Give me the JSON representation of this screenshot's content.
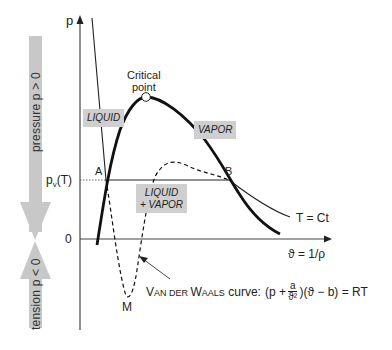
{
  "diagram": {
    "axes": {
      "y_label": "p",
      "x_label": "ϑ = 1/ρ",
      "pv_label_main": "p",
      "pv_label_sub": "v",
      "pv_label_suffix": "(T)",
      "zero_label": "0"
    },
    "regions": {
      "liquid": "LIQUID",
      "vapor": "VAPOR",
      "mixture_line1": "LIQUID",
      "mixture_line2": "+ VAPOR"
    },
    "critical_point": {
      "line1": "Critical",
      "line2": "point"
    },
    "points": {
      "a": "A",
      "b": "B",
      "m": "M"
    },
    "isotherm_label": "T = Ct",
    "vdw": {
      "prefix_v": "V",
      "prefix_an": "AN DER ",
      "prefix_w": "W",
      "prefix_aals": "AALS",
      "suffix": " curve:",
      "eq_open": "(p +",
      "eq_num": "a",
      "eq_den": "ϑ²",
      "eq_close": ")(ϑ − b) = RT"
    },
    "side_arrows": {
      "pressure": "pressure  p > 0",
      "tension": "tension  p < 0"
    },
    "colors": {
      "arrow_fill": "#c4c4c4",
      "label_box": "#cfcfcf",
      "line": "#111111"
    }
  }
}
